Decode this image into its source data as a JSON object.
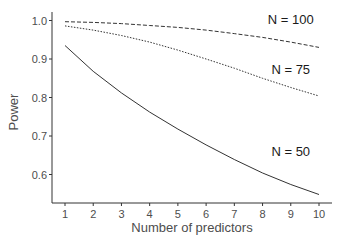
{
  "chart_data": {
    "type": "line",
    "title": "",
    "xlabel": "Number of predictors",
    "ylabel": "Power",
    "x": [
      1,
      2,
      3,
      4,
      5,
      6,
      7,
      8,
      9,
      10
    ],
    "xticks": [
      "1",
      "2",
      "3",
      "4",
      "5",
      "6",
      "7",
      "8",
      "9",
      "10"
    ],
    "yticks": [
      "0.6",
      "0.7",
      "0.8",
      "0.9",
      "1.0"
    ],
    "xlim": [
      0.55,
      10.5
    ],
    "ylim": [
      0.52,
      1.02
    ],
    "grid": false,
    "legend": "inline labels",
    "series": [
      {
        "name": "N = 100",
        "style": "dashed",
        "values": [
          0.997,
          0.995,
          0.992,
          0.987,
          0.982,
          0.975,
          0.966,
          0.956,
          0.944,
          0.93
        ]
      },
      {
        "name": "N = 75",
        "style": "dotted",
        "values": [
          0.986,
          0.975,
          0.961,
          0.944,
          0.923,
          0.9,
          0.876,
          0.85,
          0.826,
          0.804
        ]
      },
      {
        "name": "N = 50",
        "style": "solid",
        "values": [
          0.935,
          0.868,
          0.812,
          0.762,
          0.718,
          0.677,
          0.639,
          0.604,
          0.574,
          0.548
        ]
      }
    ],
    "annotations": [
      {
        "text": "N = 100",
        "x": 9.0,
        "y": 0.99
      },
      {
        "text": "N = 75",
        "x": 9.0,
        "y": 0.862
      },
      {
        "text": "N = 50",
        "x": 9.0,
        "y": 0.648
      }
    ]
  }
}
